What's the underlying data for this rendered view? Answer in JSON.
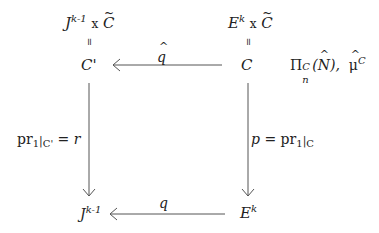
{
  "diagram": {
    "type": "commutative-diagram",
    "nodes": {
      "top_left_product": {
        "base": "J",
        "exp": "k-1",
        "times": "x",
        "factor": "C"
      },
      "top_left_equals": "=",
      "top_left": {
        "base": "C",
        "prime": "'"
      },
      "top_right_product": {
        "base": "E",
        "exp": "k",
        "times": "x",
        "factor": "C"
      },
      "top_right_equals": "=",
      "top_right": {
        "base": "C"
      },
      "bottom_left": {
        "base": "J",
        "exp": "k-1"
      },
      "bottom_right": {
        "base": "E",
        "exp": "k"
      }
    },
    "side_annotation": {
      "pi": "Π",
      "pi_sup": "C",
      "pi_sub": "n",
      "pi_arg_open": "(",
      "pi_arg": "N",
      "pi_arg_close": "),",
      "mu": "μ",
      "mu_sup": "C"
    },
    "arrows": {
      "top": {
        "label": "q",
        "from": "C",
        "to": "C'"
      },
      "bottom": {
        "label": "q",
        "from": "E^k",
        "to": "J^{k-1}"
      },
      "left": {
        "label_pr": "pr",
        "label_sub": "1",
        "label_bar": "|",
        "label_restrict": "C'",
        "label_rhs": "= r",
        "from": "C'",
        "to": "J^{k-1}"
      },
      "right": {
        "label_lhs": "p",
        "label_eq": "= pr",
        "label_sub": "1",
        "label_bar": "|",
        "label_restrict": "C",
        "from": "C",
        "to": "E^k"
      }
    }
  }
}
